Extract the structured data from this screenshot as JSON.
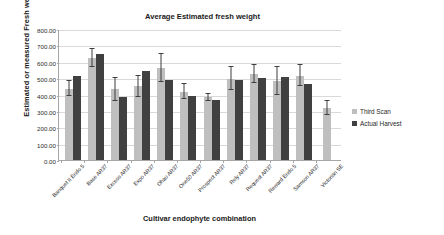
{
  "chart_data": {
    "type": "bar",
    "title": "Average Estimated fresh weight",
    "xlabel": "Cultivar endophyte combination",
    "ylabel": "Estimated or measured Fresh weight (g)",
    "ylim": [
      0,
      800
    ],
    "ytick_step": 100,
    "ytick_labels": [
      "800.00",
      "700.00",
      "600.00",
      "500.00",
      "400.00",
      "300.00",
      "200.00",
      "100.00",
      "0.00"
    ],
    "grid": "horizontal",
    "legend_position": "right",
    "categories": [
      "Banquet II Endo 5",
      "Base AR37",
      "Excess AR37",
      "Expo AR37",
      "Ohau AR37",
      "One50 AR37",
      "Prospect AR37",
      "Rely AR37",
      "Request AR37",
      "Reward Endo 5",
      "Samson AR37",
      "Victorian SE"
    ],
    "series": [
      {
        "name": "Third Scan",
        "color": "#bfbfbf",
        "values": [
          440,
          630,
          435,
          455,
          565,
          420,
          385,
          500,
          530,
          485,
          520,
          320
        ],
        "errors": [
          45,
          55,
          70,
          65,
          85,
          45,
          20,
          70,
          55,
          85,
          65,
          45
        ]
      },
      {
        "name": "Actual Harvest",
        "color": "#404040",
        "values": [
          520,
          655,
          390,
          545,
          490,
          395,
          370,
          490,
          505,
          510,
          465,
          null
        ],
        "errors": [
          0,
          0,
          0,
          0,
          0,
          0,
          0,
          0,
          0,
          0,
          0,
          null
        ]
      }
    ]
  },
  "legend": {
    "items": [
      {
        "label": "Third Scan",
        "color": "#bfbfbf"
      },
      {
        "label": "Actual Harvest",
        "color": "#404040"
      }
    ]
  }
}
